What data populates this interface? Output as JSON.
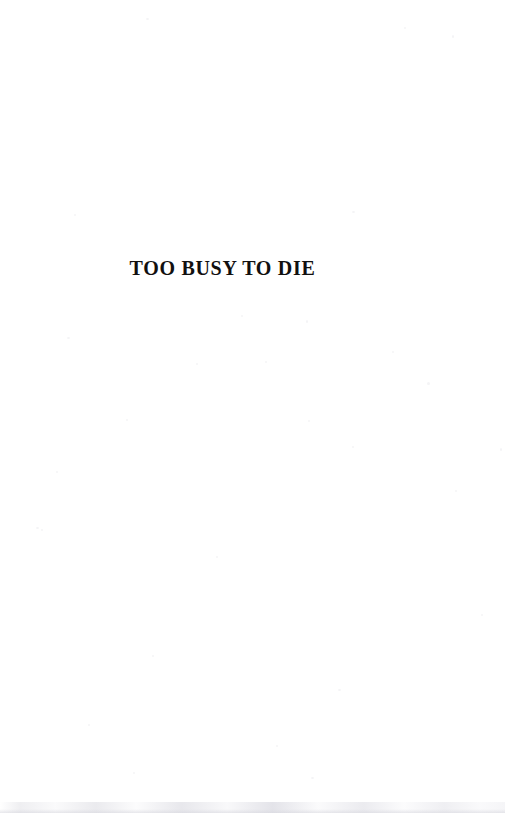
{
  "document": {
    "page_type": "half-title-page",
    "background_color": "#ffffff",
    "text_color": "#12100f"
  },
  "halftitle": {
    "text": "TOO BUSY TO DIE"
  },
  "artifacts": {
    "bottom_edge_shadow_color": "#e2e2e8",
    "speckle_color": "#f4f4f6",
    "speckles": [
      {
        "x": 146,
        "y": 18,
        "w": 3,
        "h": 2
      },
      {
        "x": 404,
        "y": 27,
        "w": 2,
        "h": 2
      },
      {
        "x": 452,
        "y": 35,
        "w": 2,
        "h": 3
      },
      {
        "x": 74,
        "y": 214,
        "w": 2,
        "h": 2
      },
      {
        "x": 352,
        "y": 211,
        "w": 3,
        "h": 2
      },
      {
        "x": 241,
        "y": 315,
        "w": 2,
        "h": 2
      },
      {
        "x": 306,
        "y": 320,
        "w": 2,
        "h": 3
      },
      {
        "x": 67,
        "y": 337,
        "w": 3,
        "h": 2
      },
      {
        "x": 392,
        "y": 351,
        "w": 2,
        "h": 2
      },
      {
        "x": 265,
        "y": 361,
        "w": 2,
        "h": 2
      },
      {
        "x": 196,
        "y": 363,
        "w": 2,
        "h": 2
      },
      {
        "x": 427,
        "y": 382,
        "w": 3,
        "h": 3
      },
      {
        "x": 126,
        "y": 419,
        "w": 2,
        "h": 2
      },
      {
        "x": 308,
        "y": 420,
        "w": 2,
        "h": 2
      },
      {
        "x": 56,
        "y": 471,
        "w": 2,
        "h": 2
      },
      {
        "x": 352,
        "y": 446,
        "w": 2,
        "h": 2
      },
      {
        "x": 500,
        "y": 448,
        "w": 2,
        "h": 3
      },
      {
        "x": 36,
        "y": 527,
        "w": 3,
        "h": 2
      },
      {
        "x": 455,
        "y": 490,
        "w": 2,
        "h": 2
      },
      {
        "x": 216,
        "y": 556,
        "w": 2,
        "h": 2
      },
      {
        "x": 41,
        "y": 529,
        "w": 2,
        "h": 2
      },
      {
        "x": 481,
        "y": 614,
        "w": 2,
        "h": 2
      },
      {
        "x": 152,
        "y": 655,
        "w": 2,
        "h": 2
      },
      {
        "x": 338,
        "y": 689,
        "w": 3,
        "h": 2
      },
      {
        "x": 88,
        "y": 724,
        "w": 2,
        "h": 2
      },
      {
        "x": 276,
        "y": 745,
        "w": 2,
        "h": 2
      },
      {
        "x": 133,
        "y": 772,
        "w": 2,
        "h": 2
      },
      {
        "x": 311,
        "y": 777,
        "w": 3,
        "h": 2
      }
    ]
  }
}
